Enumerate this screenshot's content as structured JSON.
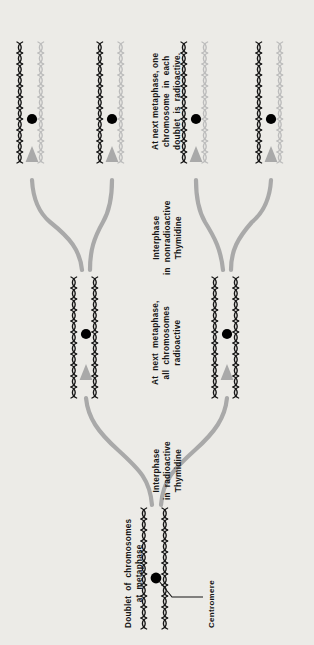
{
  "figure": {
    "background_color": "#ecebe7",
    "ink_color": "#151515",
    "faint_strand_color": "#b9b9b9",
    "arrow_color": "#a9a9a9",
    "centromere_color": "#000000"
  },
  "captions": {
    "top_stage": "At next metaphase, one\nchromosome  in  each\ndoublet  is  radioactive.",
    "middle_transition": "Interphase\nin  nonradioactive\nThymidine",
    "middle_stage": "At  next  metaphase,\nall  chromosomes\nradioactive",
    "bottom_transition": "Interphase\nin  radioactive\nThymidine",
    "bottom_stage": "Doublet  of  chromosomes\nat  metaphase",
    "centromere_label": "Centromere"
  },
  "rows": [
    {
      "name": "top-row",
      "stage": "second-metaphase",
      "doublet_count": 4,
      "doublets": [
        {
          "name": "doublet-1",
          "strands": [
            "radioactive",
            "nonradioactive"
          ]
        },
        {
          "name": "doublet-2",
          "strands": [
            "radioactive",
            "nonradioactive"
          ]
        },
        {
          "name": "doublet-3",
          "strands": [
            "radioactive",
            "nonradioactive"
          ]
        },
        {
          "name": "doublet-4",
          "strands": [
            "radioactive",
            "nonradioactive"
          ]
        }
      ]
    },
    {
      "name": "middle-row",
      "stage": "first-metaphase",
      "doublet_count": 2,
      "doublets": [
        {
          "name": "doublet-1",
          "strands": [
            "radioactive",
            "radioactive"
          ]
        },
        {
          "name": "doublet-2",
          "strands": [
            "radioactive",
            "radioactive"
          ]
        }
      ]
    },
    {
      "name": "bottom-row",
      "stage": "initial-metaphase",
      "doublet_count": 1,
      "doublets": [
        {
          "name": "doublet-1",
          "strands": [
            "radioactive",
            "radioactive"
          ]
        }
      ]
    }
  ]
}
